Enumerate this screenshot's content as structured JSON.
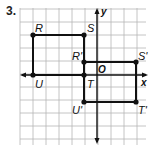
{
  "problem": {
    "number": "3."
  },
  "axes": {
    "x_label": "x",
    "y_label": "y",
    "origin_label": "O"
  },
  "grid": {
    "x0": 20,
    "y0": 8,
    "step": 13,
    "cols": 9.6,
    "rows": 10.5,
    "color": "#b5b5b5"
  },
  "points": [
    {
      "label": "R",
      "x": 33,
      "y": 35,
      "lx": 35,
      "ly": 32,
      "anchor": "start"
    },
    {
      "label": "S",
      "x": 84,
      "y": 35,
      "lx": 87,
      "ly": 32,
      "anchor": "start"
    },
    {
      "label": "U",
      "x": 33,
      "y": 75,
      "lx": 35,
      "ly": 88,
      "anchor": "start"
    },
    {
      "label": "T",
      "x": 84,
      "y": 75,
      "lx": 87,
      "ly": 88,
      "anchor": "start"
    },
    {
      "label": "R'",
      "x": 84,
      "y": 62,
      "lx": 82,
      "ly": 60,
      "anchor": "end"
    },
    {
      "label": "S'",
      "x": 136,
      "y": 62,
      "lx": 138,
      "ly": 60,
      "anchor": "start"
    },
    {
      "label": "U'",
      "x": 84,
      "y": 102,
      "lx": 82,
      "ly": 114,
      "anchor": "end"
    },
    {
      "label": "T'",
      "x": 136,
      "y": 102,
      "lx": 138,
      "ly": 114,
      "anchor": "start"
    }
  ],
  "rectangles": [
    {
      "name": "RSTU",
      "vertices": [
        "R",
        "S",
        "T",
        "U"
      ]
    },
    {
      "name": "R'S'T'U'",
      "vertices": [
        "R'",
        "S'",
        "T'",
        "U'"
      ]
    }
  ],
  "colors": {
    "ink": "#111111",
    "grid": "#b5b5b5"
  }
}
